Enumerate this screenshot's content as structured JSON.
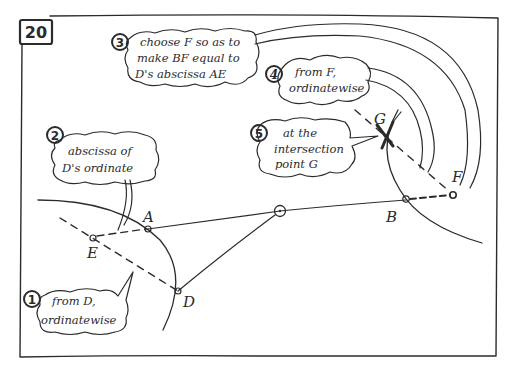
{
  "panel": {
    "number": "20"
  },
  "points": {
    "A": {
      "label": "A",
      "x": 148,
      "y": 229
    },
    "B": {
      "label": "B",
      "x": 406,
      "y": 200
    },
    "D": {
      "label": "D",
      "x": 178,
      "y": 291
    },
    "E": {
      "label": "E",
      "x": 93,
      "y": 238
    },
    "F": {
      "label": "F",
      "x": 453,
      "y": 195
    },
    "G": {
      "label": "G",
      "x": 385,
      "y": 135
    },
    "O": {
      "label": "",
      "x": 280,
      "y": 211
    }
  },
  "steps": [
    {
      "number": "1",
      "lines": [
        "from D,",
        "ordinatewise"
      ]
    },
    {
      "number": "2",
      "lines": [
        "abscissa of",
        "D's ordinate"
      ]
    },
    {
      "number": "3",
      "lines": [
        "choose F so as to",
        "make BF equal to",
        "D's abscissa AE"
      ]
    },
    {
      "number": "4",
      "lines": [
        "from F,",
        "ordinatewise"
      ]
    },
    {
      "number": "5",
      "lines": [
        "at the",
        "intersection",
        "point G"
      ]
    }
  ],
  "colors": {
    "ink": "#2b2b2b",
    "paper": "#ffffff"
  }
}
